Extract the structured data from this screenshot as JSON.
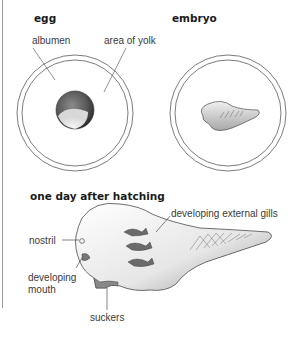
{
  "panels": {
    "egg": {
      "heading": "egg",
      "labels": {
        "albumen": "albumen",
        "yolk": "area of yolk"
      }
    },
    "embryo": {
      "heading": "embryo"
    },
    "hatchling": {
      "heading": "one day after hatching",
      "labels": {
        "gills": "developing external gills",
        "nostril": "nostril",
        "mouth_line1": "developing",
        "mouth_line2": "mouth",
        "suckers": "suckers"
      }
    }
  },
  "colors": {
    "line": "#3a3a3a",
    "rule": "#9a9a9a",
    "stipple": "#555555"
  }
}
